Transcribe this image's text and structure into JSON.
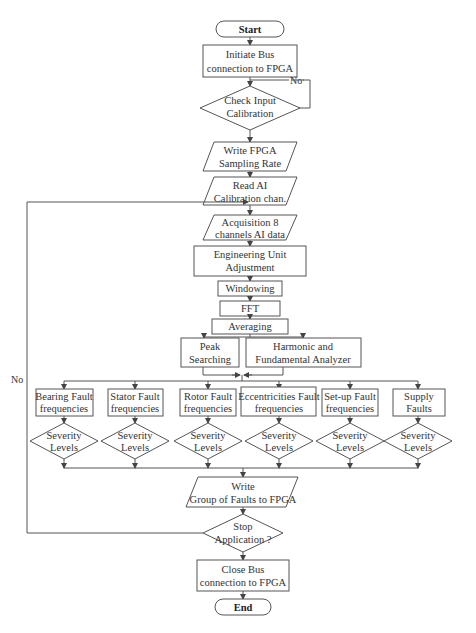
{
  "flowchart": {
    "start": "Start",
    "init_bus": [
      "Initiate Bus",
      "connection to FPGA"
    ],
    "check_calib": [
      "Check Input",
      "Calibration"
    ],
    "no_label_top": "No",
    "write_rate": [
      "Write FPGA",
      "Sampling Rate"
    ],
    "read_ai": [
      "Read AI",
      "Calibration chan."
    ],
    "acquisition": [
      "Acquisition 8",
      "channels AI data"
    ],
    "eng_unit": [
      "Engineering Unit",
      "Adjustment"
    ],
    "windowing": "Windowing",
    "fft": "FFT",
    "averaging": "Averaging",
    "peak": [
      "Peak",
      "Searching"
    ],
    "harmonic": [
      "Harmonic and",
      "Fundamental Analyzer"
    ],
    "faults": [
      {
        "l1": "Bearing Fault",
        "l2": "frequencies"
      },
      {
        "l1": "Stator Fault",
        "l2": "frequencies"
      },
      {
        "l1": "Rotor Fault",
        "l2": "frequencies"
      },
      {
        "l1": "Eccentricities Fault",
        "l2": "frequencies"
      },
      {
        "l1": "Set-up Fault",
        "l2": "frequencies"
      },
      {
        "l1": "Supply",
        "l2": "Faults"
      }
    ],
    "severity": [
      "Severity",
      "Levels"
    ],
    "write_group": [
      "Write",
      "Group of Faults to FPGA"
    ],
    "stop": [
      "Stop",
      "Application ?"
    ],
    "no_label_left": "No",
    "close_bus": [
      "Close Bus",
      "connection to FPGA"
    ],
    "end": "End"
  }
}
